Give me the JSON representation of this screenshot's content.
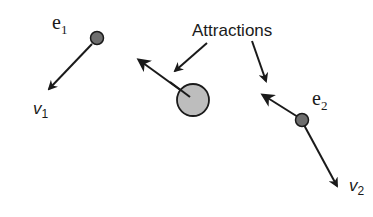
{
  "diagram": {
    "callout": {
      "text": "Attractions"
    },
    "entities": [
      {
        "id": "e1",
        "label_main": "e",
        "label_sub": "1",
        "velocity_main": "v",
        "velocity_sub": "1"
      },
      {
        "id": "e2",
        "label_main": "e",
        "label_sub": "2",
        "velocity_main": "v",
        "velocity_sub": "2"
      }
    ],
    "attractor": {
      "label": ""
    },
    "colors": {
      "stroke": "#1a1a1a",
      "entity_fill": "#6e6e6e",
      "attractor_fill": "#bdbdbd",
      "background": "#ffffff"
    }
  }
}
